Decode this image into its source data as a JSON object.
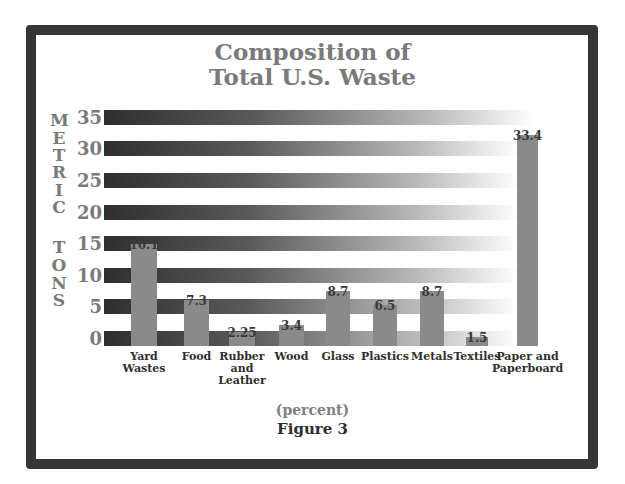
{
  "chart_data": {
    "type": "bar",
    "title_lines": [
      "Composition of",
      "Total U.S. Waste"
    ],
    "xlabel": "(percent)",
    "ylabel": "METRIC TONS",
    "ylabel_letters": [
      "M",
      "E",
      "T",
      "R",
      "I",
      "C",
      "T",
      "O",
      "N",
      "S"
    ],
    "caption": "Figure 3",
    "categories": [
      "Yard Wastes",
      "Food",
      "Rubber and Leather",
      "Wood",
      "Glass",
      "Plastics",
      "Metals",
      "Textiles",
      "Paper and Paperboard"
    ],
    "category_lines": [
      [
        "Yard",
        "Wastes"
      ],
      [
        "Food"
      ],
      [
        "Rubber",
        "and",
        "Leather"
      ],
      [
        "Wood"
      ],
      [
        "Glass"
      ],
      [
        "Plastics"
      ],
      [
        "Metals"
      ],
      [
        "Textiles"
      ],
      [
        "Paper and",
        "Paperboard"
      ]
    ],
    "values": [
      16.1,
      7.3,
      2.25,
      3.4,
      8.7,
      6.5,
      8.7,
      1.5,
      33.4
    ],
    "value_labels": [
      "16.1",
      "7.3",
      "2.25",
      "3.4",
      "8.7",
      "6.5",
      "8.7",
      "1.5",
      "33.4"
    ],
    "yticks": [
      "35",
      "30",
      "25",
      "20",
      "15",
      "10",
      "5",
      "0"
    ],
    "ylim": [
      0,
      35
    ],
    "grid": "gradient horizontal stripes at each tick",
    "legend": null,
    "colors": {
      "bar": "#8a8a8a",
      "stripe_start": "#2e2e2e",
      "stripe_end": "#ffffff",
      "text": "#7a7a7a",
      "frame": "#363636"
    }
  }
}
